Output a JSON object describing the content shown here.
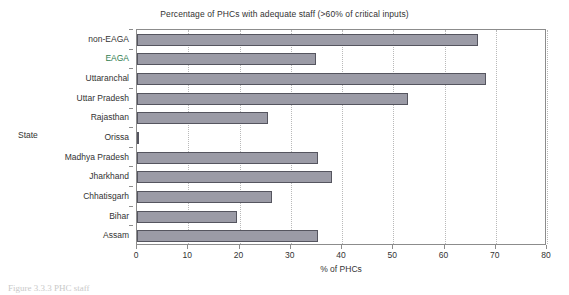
{
  "chart_data": {
    "type": "bar",
    "orientation": "horizontal",
    "title": "Percentage of PHCs with adequate staff (>60% of critical inputs)",
    "xlabel": "% of PHCs",
    "ylabel": "State",
    "xlim": [
      0,
      80
    ],
    "x_ticks": [
      0,
      10,
      20,
      30,
      40,
      50,
      60,
      70,
      80
    ],
    "x_tick_labels": [
      "0",
      "10",
      "20",
      "30",
      "40",
      "50",
      "60",
      "70",
      "80"
    ],
    "grid": "vertical-dotted",
    "legend": "none",
    "bar_color": "#9b9ba6",
    "bar_edge_color": "#55555f",
    "categories": [
      "non-EAGA",
      "EAGA",
      "Uttaranchal",
      "Uttar Pradesh",
      "Rajasthan",
      "Orissa",
      "Madhya Pradesh",
      "Jharkhand",
      "Chhatisgarh",
      "Bihar",
      "Assam"
    ],
    "values": [
      66.5,
      35.0,
      68.0,
      52.9,
      25.6,
      0.3,
      35.3,
      38.0,
      26.4,
      19.5,
      35.3
    ],
    "highlight_categories": [
      "EAGA"
    ],
    "highlight_color": "#2f7d4f"
  },
  "caption": {
    "text": "Figure 3.3.3  PHC staff"
  }
}
